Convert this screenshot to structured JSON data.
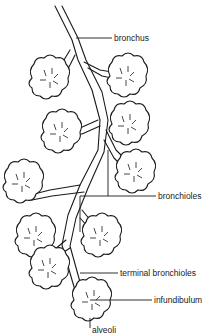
{
  "diagram": {
    "labels": {
      "bronchus": "bronchus",
      "bronchioles": "bronchioles",
      "terminal_bronchioles": "terminal bronchioles",
      "infundibulum": "infundibulum",
      "alveoli": "alveoli"
    },
    "colors": {
      "line": "#1a1a1a",
      "background": "#ffffff"
    }
  }
}
